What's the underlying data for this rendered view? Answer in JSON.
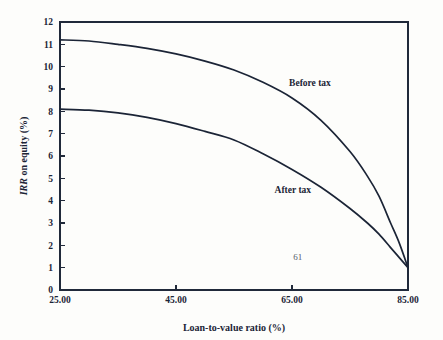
{
  "chart_data": {
    "type": "line",
    "title": "",
    "xlabel": "Loan-to-value ratio (%)",
    "ylabel": "IRR on equity (%)",
    "ylabel_italic_part": "IRR",
    "ylabel_rest": " on equity (%)",
    "xlim": [
      25,
      85
    ],
    "ylim": [
      0,
      12
    ],
    "grid": false,
    "legend_position": "inline-annotation",
    "x_tick_labels": [
      "25.00",
      "45.00",
      "65.00",
      "85.00"
    ],
    "x_ticks": [
      25,
      45,
      65,
      85
    ],
    "y_ticks": [
      0,
      1,
      2,
      3,
      4,
      5,
      6,
      7,
      8,
      9,
      10,
      11,
      12
    ],
    "y_tick_labels": [
      "0",
      "1",
      "2",
      "3",
      "4",
      "5",
      "6",
      "7",
      "8",
      "9",
      "10",
      "11",
      "12"
    ],
    "x": [
      25,
      30,
      35,
      40,
      45,
      50,
      55,
      60,
      65,
      70,
      75,
      78,
      80,
      82,
      83.5,
      85
    ],
    "series": [
      {
        "name": "Before tax",
        "label": "Before tax",
        "label_x": 64.5,
        "label_y": 9.15,
        "values": [
          11.2,
          11.15,
          11.0,
          10.82,
          10.57,
          10.25,
          9.85,
          9.3,
          8.6,
          7.6,
          6.2,
          5.1,
          4.2,
          3.0,
          2.1,
          1.0
        ]
      },
      {
        "name": "After tax",
        "label": "After tax",
        "label_x": 62.0,
        "label_y": 4.35,
        "values": [
          8.1,
          8.05,
          7.93,
          7.73,
          7.45,
          7.1,
          6.72,
          6.1,
          5.4,
          4.6,
          3.65,
          3.0,
          2.5,
          1.9,
          1.45,
          1.0
        ]
      }
    ],
    "annotations": [
      {
        "name": "page-number",
        "text": "61",
        "x": 66.0,
        "y": 1.35
      }
    ],
    "colors": {
      "line": "#1b2436",
      "axis": "#20293a",
      "background": "#fdfdfb",
      "text": "#1b2436",
      "annotation_text": "#55596a"
    }
  }
}
